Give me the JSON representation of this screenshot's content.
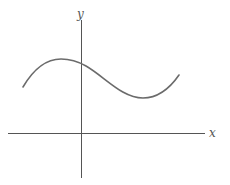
{
  "diagram": {
    "title": "",
    "axes": {
      "x_label": "x",
      "y_label": "y"
    },
    "curve": {
      "description": "smooth cubic-like curve: local maximum left of y-axis, local minimum right of y-axis, entirely above x-axis",
      "color": "#6b6b6b"
    },
    "colors": {
      "axis": "#555555",
      "background": "#ffffff"
    }
  }
}
